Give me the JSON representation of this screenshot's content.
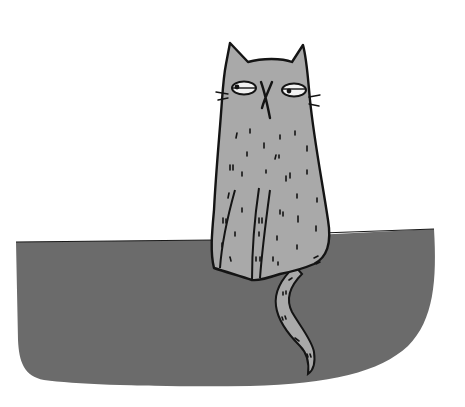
{
  "scene": {
    "title": "Grumpy cat sitting on a wall",
    "subject": "cat",
    "colors": {
      "background": "#ffffff",
      "wall": "#6b6b6b",
      "cat_fill": "#a9a9a9",
      "outline": "#141414",
      "eye_white": "#f2f2f2"
    }
  }
}
